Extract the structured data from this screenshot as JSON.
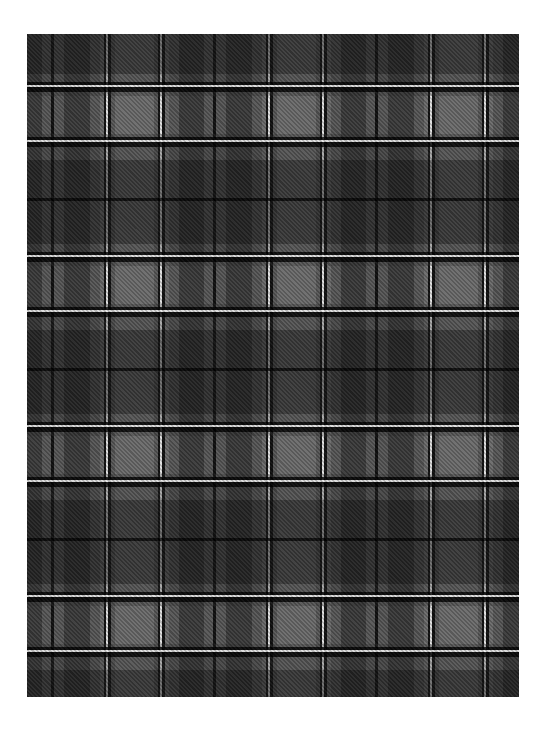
{
  "image": {
    "subject": "grey and black tartan plaid fabric swatch",
    "pattern": {
      "type": "tartan",
      "sett_width_px": 162,
      "sett_height_px": 170,
      "weave": "twill diagonal"
    },
    "colors": {
      "background": "#ffffff",
      "light_grey": "#6c6c6c",
      "dark_grey": "#2e2e2e",
      "black_stripe": "#111111",
      "white_stripe": "#e6e6e6"
    },
    "bounds": {
      "left": 27,
      "top": 34,
      "width": 492,
      "height": 663
    }
  }
}
